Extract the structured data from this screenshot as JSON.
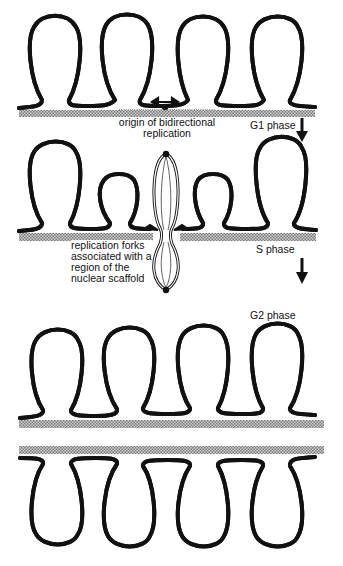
{
  "figure": {
    "stages": [
      {
        "id": "g1",
        "label": "G1 phase"
      },
      {
        "id": "s",
        "label": "S phase"
      },
      {
        "id": "g2",
        "label": "G2 phase"
      }
    ],
    "annotations": {
      "origin_line1": "origin of bidirectional",
      "origin_line2": "replication",
      "forks_line1": "replication  forks",
      "forks_line2": "associated with a",
      "forks_line3": "region of the",
      "forks_line4": "nuclear scaffold"
    },
    "colors": {
      "line": "#111111",
      "scaffold": "#9a9a9a",
      "background": "#ffffff"
    }
  }
}
